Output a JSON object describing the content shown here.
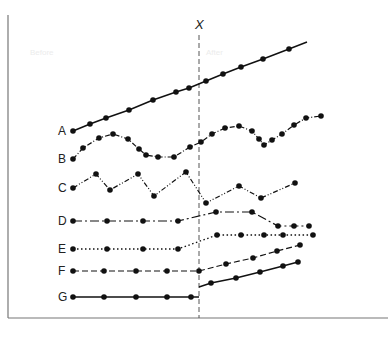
{
  "diagram": {
    "title": "",
    "marker_label": "X",
    "marker_x": 199,
    "faint_labels": [
      {
        "text": "Before",
        "x": 30,
        "y": 55
      },
      {
        "text": "After",
        "x": 206,
        "y": 55
      }
    ],
    "frame": {
      "left": 8,
      "top": 15,
      "bottom": 318,
      "right": 388
    },
    "series": [
      {
        "name": "A",
        "label_x": 58,
        "label_y": 135,
        "dash": "",
        "width": 1.5,
        "points": [
          [
            73,
            131
          ],
          [
            90,
            124
          ],
          [
            106,
            118
          ],
          [
            129,
            110
          ],
          [
            153,
            100
          ],
          [
            176,
            92
          ],
          [
            189,
            88
          ],
          [
            206,
            81
          ],
          [
            223,
            74
          ],
          [
            241,
            67
          ],
          [
            263,
            59
          ],
          [
            289,
            49
          ]
        ],
        "extend_to": [
          307,
          42
        ]
      },
      {
        "name": "B",
        "label_x": 58,
        "label_y": 163,
        "dash": "5 2 1 2",
        "width": 1.2,
        "points": [
          [
            73,
            159
          ],
          [
            83,
            148
          ],
          [
            99,
            138
          ],
          [
            113,
            134
          ],
          [
            128,
            139
          ],
          [
            139,
            149
          ],
          [
            146,
            155
          ],
          [
            158,
            157
          ],
          [
            174,
            157
          ],
          [
            190,
            147
          ],
          [
            201,
            142
          ],
          [
            212,
            134
          ],
          [
            225,
            128
          ],
          [
            239,
            126
          ],
          [
            252,
            131
          ],
          [
            259,
            139
          ],
          [
            264,
            145
          ],
          [
            272,
            140
          ],
          [
            282,
            134
          ],
          [
            294,
            125
          ],
          [
            306,
            118
          ],
          [
            321,
            116
          ]
        ]
      },
      {
        "name": "C",
        "label_x": 58,
        "label_y": 192,
        "dash": "5 2 1 2 1 2",
        "width": 1.2,
        "points": [
          [
            73,
            188
          ],
          [
            96,
            174
          ],
          [
            110,
            190
          ],
          [
            138,
            174
          ],
          [
            154,
            196
          ],
          [
            186,
            172
          ],
          [
            206,
            203
          ],
          [
            239,
            186
          ],
          [
            261,
            198
          ],
          [
            295,
            183
          ]
        ]
      },
      {
        "name": "D",
        "label_x": 58,
        "label_y": 225,
        "dash": "9 3 2 3",
        "width": 1.2,
        "points": [
          [
            73,
            221
          ],
          [
            107,
            221
          ],
          [
            143,
            221
          ],
          [
            178,
            221
          ],
          [
            216,
            212
          ],
          [
            252,
            212
          ],
          [
            278,
            226
          ],
          [
            294,
            226
          ],
          [
            309,
            226
          ]
        ]
      },
      {
        "name": "E",
        "label_x": 58,
        "label_y": 253,
        "dash": "1.5 2.5",
        "width": 1.3,
        "points": [
          [
            73,
            249
          ],
          [
            107,
            249
          ],
          [
            143,
            249
          ],
          [
            178,
            249
          ],
          [
            217,
            235
          ],
          [
            241,
            235
          ],
          [
            264,
            235
          ],
          [
            283,
            235
          ],
          [
            313,
            235
          ]
        ]
      },
      {
        "name": "F",
        "label_x": 58,
        "label_y": 275,
        "dash": "6 3",
        "width": 1.2,
        "points": [
          [
            73,
            271
          ],
          [
            104,
            271
          ],
          [
            136,
            271
          ],
          [
            167,
            271
          ],
          [
            199,
            271
          ],
          [
            226,
            264
          ],
          [
            253,
            258
          ],
          [
            277,
            251
          ],
          [
            300,
            245
          ]
        ]
      },
      {
        "name": "G",
        "label_x": 58,
        "label_y": 301,
        "dash": "",
        "width": 1.5,
        "segments": [
          [
            [
              73,
              297
            ],
            [
              104,
              297
            ],
            [
              136,
              297
            ],
            [
              167,
              297
            ],
            [
              191,
              297
            ],
            [
              199,
              297
            ]
          ],
          [
            [
              199,
              287
            ],
            [
              211,
              283
            ],
            [
              236,
              278
            ],
            [
              260,
              272
            ],
            [
              283,
              266
            ],
            [
              298,
              262
            ]
          ]
        ],
        "dots": [
          [
            73,
            297
          ],
          [
            104,
            297
          ],
          [
            136,
            297
          ],
          [
            167,
            297
          ],
          [
            191,
            297
          ],
          [
            211,
            283
          ],
          [
            236,
            278
          ],
          [
            260,
            272
          ],
          [
            283,
            266
          ],
          [
            298,
            262
          ]
        ]
      }
    ]
  }
}
